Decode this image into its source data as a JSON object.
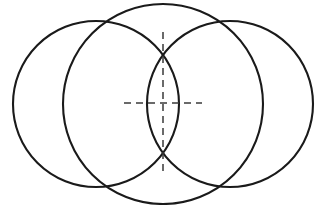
{
  "figure": {
    "canvas": {
      "width": 327,
      "height": 205,
      "background_color": "#ffffff"
    },
    "style": {
      "circle_stroke_color": "#1a1a1a",
      "circle_stroke_width": 2.1,
      "axis_stroke_color": "#3a3a3a",
      "axis_stroke_width": 1.5,
      "axis_dash_pattern": "7 5"
    }
  },
  "chart_data": {
    "type": "scatter",
    "xlabel": "",
    "ylabel": "",
    "xlim": [
      0,
      327
    ],
    "ylim": [
      0,
      205
    ],
    "grid": false,
    "legend": "none",
    "shapes": [
      {
        "name": "left-circle",
        "type": "circle",
        "cx": 96,
        "cy": 104,
        "r": 83
      },
      {
        "name": "middle-circle",
        "type": "circle",
        "cx": 163,
        "cy": 104,
        "r": 100
      },
      {
        "name": "right-circle",
        "type": "circle",
        "cx": 230,
        "cy": 104,
        "r": 83
      },
      {
        "name": "vertical-axis",
        "type": "dashed-line",
        "x1": 163,
        "y1": 32,
        "x2": 163,
        "y2": 176
      },
      {
        "name": "horizontal-axis",
        "type": "dashed-line",
        "x1": 124,
        "y1": 103,
        "x2": 202,
        "y2": 103
      }
    ],
    "key_points": [
      {
        "name": "lens-top-vertex",
        "x": 163,
        "y": 32
      },
      {
        "name": "lens-bottom-vertex",
        "x": 163,
        "y": 176
      },
      {
        "name": "lens-left-extreme",
        "x": 124,
        "y": 103
      },
      {
        "name": "lens-right-extreme",
        "x": 202,
        "y": 103
      },
      {
        "name": "center-crosshair",
        "x": 163,
        "y": 103
      },
      {
        "name": "upper-left-crossing",
        "x": 130,
        "y": 13
      },
      {
        "name": "upper-right-crossing",
        "x": 197,
        "y": 13
      },
      {
        "name": "lower-left-crossing",
        "x": 130,
        "y": 194
      },
      {
        "name": "lower-right-crossing",
        "x": 197,
        "y": 194
      },
      {
        "name": "leftmost-extent",
        "x": 13,
        "y": 104
      },
      {
        "name": "rightmost-extent",
        "x": 313,
        "y": 104
      },
      {
        "name": "topmost-extent",
        "x": 163,
        "y": 10
      },
      {
        "name": "bottommost-extent",
        "x": 163,
        "y": 197
      }
    ]
  }
}
